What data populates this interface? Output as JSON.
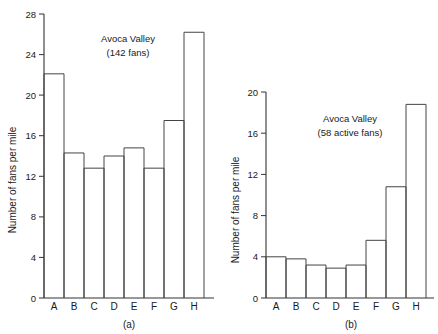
{
  "figure": {
    "background": "#ffffff",
    "ink_color": "#333333"
  },
  "chart_data": [
    {
      "type": "bar",
      "panel_label": "(a)",
      "title": "Avoca Valley",
      "subtitle": "(142 fans)",
      "xlabel": "",
      "ylabel": "Number of fans per mile",
      "categories": [
        "A",
        "B",
        "C",
        "D",
        "E",
        "F",
        "G",
        "H"
      ],
      "values": [
        22.1,
        14.3,
        12.8,
        14.0,
        14.8,
        12.8,
        17.5,
        26.2
      ],
      "yticks": [
        0,
        4,
        8,
        12,
        16,
        20,
        24,
        28
      ],
      "ytick_labels": [
        "0",
        "4",
        "8",
        "12",
        "16",
        "20",
        "24",
        "28"
      ],
      "ylim": [
        0,
        28
      ],
      "grid": false,
      "legend": "none"
    },
    {
      "type": "bar",
      "panel_label": "(b)",
      "title": "Avoca Valley",
      "subtitle": "(58 active fans)",
      "xlabel": "",
      "ylabel": "Number of fans per mile",
      "categories": [
        "A",
        "B",
        "C",
        "D",
        "E",
        "F",
        "G",
        "H"
      ],
      "values": [
        4.0,
        3.8,
        3.2,
        2.9,
        3.2,
        5.6,
        10.8,
        18.8
      ],
      "yticks": [
        0,
        4,
        8,
        12,
        16,
        20
      ],
      "ytick_labels": [
        "0",
        "4",
        "8",
        "12",
        "16",
        "20"
      ],
      "ylim": [
        0,
        20
      ],
      "grid": false,
      "legend": "none"
    }
  ]
}
